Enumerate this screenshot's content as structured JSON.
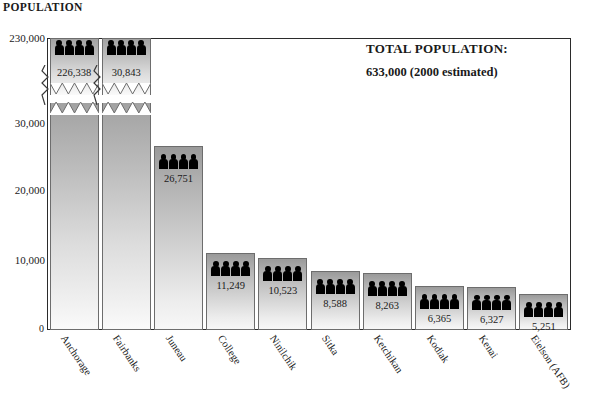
{
  "y_axis_title": "POPULATION",
  "total_panel": {
    "title": "TOTAL POPULATION:",
    "value": "633,000  (2000 estimated)"
  },
  "chart_data": {
    "type": "bar",
    "title": "POPULATION",
    "xlabel": "",
    "ylabel": "POPULATION",
    "grid": false,
    "legend": "none",
    "axis_break": true,
    "axis_break_note": "y-axis broken between 30,000 and 230,000",
    "ylim": [
      0,
      230000
    ],
    "ytick_labels": [
      "230,000",
      "30,000",
      "20,000",
      "10,000",
      "0"
    ],
    "ytick_values": [
      230000,
      30000,
      20000,
      10000,
      0
    ],
    "categories": [
      "Anchorage",
      "Fairbanks",
      "Juneau",
      "College",
      "Ninilchik",
      "Sitka",
      "Ketchikan",
      "Kodiak",
      "Kenai",
      "Eielson (AFB)"
    ],
    "values": [
      226338,
      30843,
      26751,
      11249,
      10523,
      8588,
      8263,
      6365,
      6327,
      5251
    ],
    "value_labels": [
      "226,338",
      "30,843",
      "26,751",
      "11,249",
      "10,523",
      "8,588",
      "8,263",
      "6,365",
      "6,327",
      "5,251"
    ],
    "bar_icon": "people-group-icon",
    "icons_per_bar": 4,
    "colors": {
      "bar_top": "#9a9a9a",
      "bar_bottom": "#f7f7f7",
      "bar_border": "#6d6d6d",
      "axis": "#2b2b2b",
      "text": "#1a1a1a"
    }
  }
}
